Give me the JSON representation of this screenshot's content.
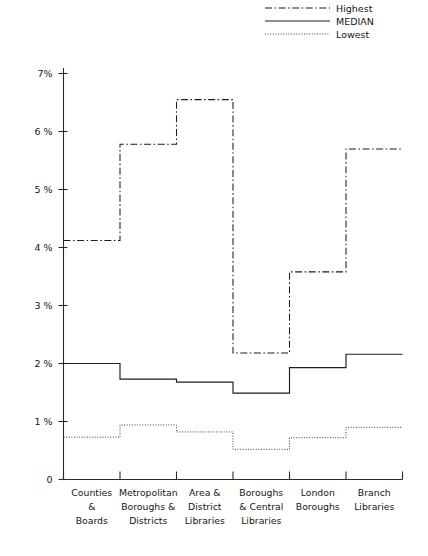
{
  "chart_data": {
    "type": "line",
    "title": "",
    "subtitle": "",
    "xlabel": "",
    "ylabel": "",
    "grid": false,
    "step_style": "step-post",
    "legend_position": "top-right",
    "ylim": [
      0,
      7
    ],
    "ytick_labels": [
      "7%",
      "6 %",
      "5 %",
      "4 %",
      "3 %",
      "2 %",
      "1 %",
      "0"
    ],
    "ytick_values": [
      7,
      6,
      5,
      4,
      3,
      2,
      1,
      0
    ],
    "categories": [
      "Counties\n&\nBoards",
      "Metropolitan\nBoroughs &\nDistricts",
      "Area &\nDistrict\nLibraries",
      "Boroughs\n& Central\nLibraries",
      "London\nBoroughs",
      "Branch\nLibraries"
    ],
    "category_lines": [
      [
        "Counties",
        "&",
        "Boards"
      ],
      [
        "Metropolitan",
        "Boroughs &",
        "Districts"
      ],
      [
        "Area &",
        "District",
        "Libraries"
      ],
      [
        "Boroughs",
        "& Central",
        "Libraries"
      ],
      [
        "London",
        "Boroughs"
      ],
      [
        "Branch",
        "Libraries"
      ]
    ],
    "series": [
      {
        "name": "Highest",
        "style": "dash-dot",
        "values": [
          4.12,
          5.78,
          6.55,
          2.18,
          3.58,
          5.7
        ]
      },
      {
        "name": "MEDIAN",
        "style": "solid",
        "values": [
          2.0,
          1.73,
          1.68,
          1.49,
          1.93,
          2.16
        ]
      },
      {
        "name": "Lowest",
        "style": "dotted",
        "values": [
          0.73,
          0.94,
          0.82,
          0.52,
          0.72,
          0.9
        ]
      }
    ]
  },
  "legend": {
    "entries": [
      {
        "label": "Highest"
      },
      {
        "label": "MEDIAN"
      },
      {
        "label": "Lowest"
      }
    ]
  },
  "colors": {
    "axis": "#2a2a2a",
    "series_highest": "#1d1d1d",
    "series_median": "#1d1d1d",
    "series_lowest": "#3a3a3a",
    "background": "#ffffff",
    "text": "#161616"
  }
}
